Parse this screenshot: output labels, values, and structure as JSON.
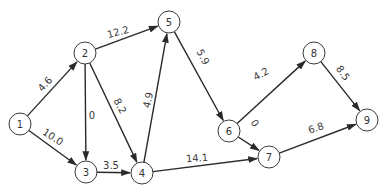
{
  "diagram": {
    "type": "directed-weighted-network",
    "node_radius": 11,
    "nodes": [
      {
        "id": "1",
        "label": "1",
        "x": 20,
        "y": 124
      },
      {
        "id": "2",
        "label": "2",
        "x": 85,
        "y": 53
      },
      {
        "id": "3",
        "label": "3",
        "x": 86,
        "y": 172
      },
      {
        "id": "4",
        "label": "4",
        "x": 142,
        "y": 173
      },
      {
        "id": "5",
        "label": "5",
        "x": 169,
        "y": 22
      },
      {
        "id": "6",
        "label": "6",
        "x": 229,
        "y": 131
      },
      {
        "id": "7",
        "label": "7",
        "x": 269,
        "y": 157
      },
      {
        "id": "8",
        "label": "8",
        "x": 314,
        "y": 53
      },
      {
        "id": "9",
        "label": "9",
        "x": 367,
        "y": 120
      }
    ],
    "edges": [
      {
        "from": "1",
        "to": "2",
        "weight": "4.6",
        "lx": 45,
        "ly": 84,
        "rot": -48
      },
      {
        "from": "1",
        "to": "3",
        "weight": "10.0",
        "lx": 53,
        "ly": 137,
        "rot": 33
      },
      {
        "from": "2",
        "to": "5",
        "weight": "12.2",
        "lx": 118,
        "ly": 32,
        "rot": -15
      },
      {
        "from": "2",
        "to": "3",
        "weight": "0",
        "lx": 92,
        "ly": 115,
        "rot": 0
      },
      {
        "from": "2",
        "to": "4",
        "weight": "8.2",
        "lx": 120,
        "ly": 106,
        "rot": 62
      },
      {
        "from": "3",
        "to": "4",
        "weight": "3.5",
        "lx": 111,
        "ly": 165,
        "rot": 0
      },
      {
        "from": "4",
        "to": "5",
        "weight": "4.9",
        "lx": 148,
        "ly": 100,
        "rot": -78
      },
      {
        "from": "4",
        "to": "7",
        "weight": "14.1",
        "lx": 197,
        "ly": 158,
        "rot": -4
      },
      {
        "from": "5",
        "to": "6",
        "weight": "5.9",
        "lx": 203,
        "ly": 57,
        "rot": 62
      },
      {
        "from": "6",
        "to": "8",
        "weight": "4.2",
        "lx": 261,
        "ly": 74,
        "rot": -28
      },
      {
        "from": "6",
        "to": "7",
        "weight": "0",
        "lx": 255,
        "ly": 123,
        "rot": 58
      },
      {
        "from": "8",
        "to": "9",
        "weight": "8.5",
        "lx": 343,
        "ly": 73,
        "rot": 55
      },
      {
        "from": "7",
        "to": "9",
        "weight": "6.8",
        "lx": 316,
        "ly": 128,
        "rot": -18
      }
    ]
  }
}
